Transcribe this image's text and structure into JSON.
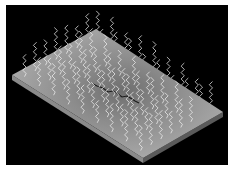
{
  "image": {
    "subject": "3D illustration of a flat gray plate with a dark crack in the center and wavy white emission lines rising from its surface",
    "style": "grayscale",
    "colors": {
      "frame_border": "#ffffff",
      "background": "#000000",
      "plate_top_light": "#b8b8b8",
      "plate_top_dark": "#6e6e6e",
      "plate_edge": "#8a8a8a",
      "plate_edge_dark": "#5a5a5a",
      "crack": "#1a1a1a",
      "wave": "#f2f2f2"
    },
    "elements": {
      "plate": "rectangular slab viewed in perspective",
      "crack": "thin dark jagged line across center of plate",
      "waves": "rows of vertical zigzag squiggles emitted upward from the plate surface"
    }
  }
}
